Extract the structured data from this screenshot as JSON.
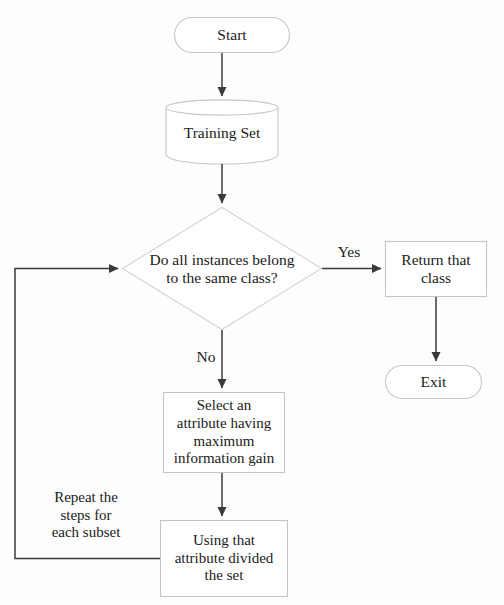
{
  "diagram": {
    "type": "flowchart",
    "colors": {
      "background": "#fdfdfd",
      "shape_outline": "#c9c9c9",
      "shape_outline_dark": "#b0b0b0",
      "connector": "#3a3a3a",
      "text": "#1b1b1b"
    },
    "nodes": [
      {
        "id": "start",
        "shape": "terminator",
        "label": "Start",
        "x": 174,
        "y": 17,
        "width": 116,
        "height": 36
      },
      {
        "id": "training-set",
        "shape": "database-cylinder",
        "label": "Training Set",
        "x": 166,
        "y": 100,
        "width": 112,
        "height": 62
      },
      {
        "id": "all-same-class",
        "shape": "decision-diamond",
        "label": "Do all instances belong\nto the same class?",
        "x": 122,
        "y": 207,
        "width": 200,
        "height": 123
      },
      {
        "id": "return-that-class",
        "shape": "process-rectangle",
        "label": "Return that\nclass",
        "x": 385,
        "y": 241,
        "width": 102,
        "height": 56
      },
      {
        "id": "exit",
        "shape": "terminator",
        "label": "Exit",
        "x": 385,
        "y": 365,
        "width": 97,
        "height": 34
      },
      {
        "id": "select-attribute",
        "shape": "process-rectangle",
        "label": "Select an\nattribute having\nmaximum\ninformation gain",
        "x": 163,
        "y": 392,
        "width": 122,
        "height": 81
      },
      {
        "id": "divide-set",
        "shape": "process-rectangle",
        "label": "Using that\nattribute divided\nthe set",
        "x": 160,
        "y": 520,
        "width": 128,
        "height": 77
      }
    ],
    "edge_labels": [
      {
        "id": "yes-label",
        "text": "Yes",
        "x": 330,
        "y": 243
      },
      {
        "id": "no-label",
        "text": "No",
        "x": 192,
        "y": 348
      },
      {
        "id": "repeat-label",
        "text": "Repeat the\nsteps for\neach subset",
        "x": 33,
        "y": 489
      }
    ],
    "edges": [
      {
        "id": "start-to-training",
        "from": "start",
        "to": "training-set"
      },
      {
        "id": "training-to-decision",
        "from": "training-set",
        "to": "all-same-class"
      },
      {
        "id": "decision-yes-to-return",
        "from": "all-same-class",
        "to": "return-that-class",
        "label": "Yes"
      },
      {
        "id": "return-to-exit",
        "from": "return-that-class",
        "to": "exit"
      },
      {
        "id": "decision-no-to-select",
        "from": "all-same-class",
        "to": "select-attribute",
        "label": "No"
      },
      {
        "id": "select-to-divide",
        "from": "select-attribute",
        "to": "divide-set"
      },
      {
        "id": "divide-loop-to-decision",
        "from": "divide-set",
        "to": "all-same-class",
        "label": "Repeat the steps for each subset"
      }
    ]
  }
}
